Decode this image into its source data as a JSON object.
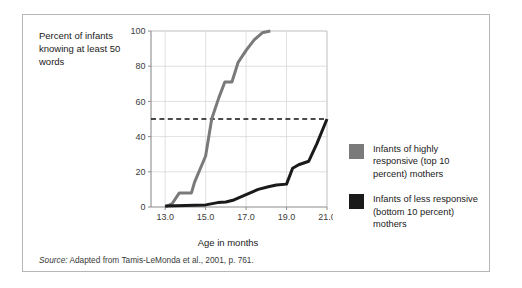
{
  "figure": {
    "y_axis_caption": "Percent of infants knowing at least 50 words",
    "source_prefix": "Source:",
    "source_text": " Adapted from Tamis-LeMonda et al., 2001, p. 761."
  },
  "legend": {
    "items": [
      {
        "label": "Infants of highly responsive (top 10 percent) mothers",
        "color": "#7a7a7a",
        "swatch_name": "legend-swatch-highly-responsive"
      },
      {
        "label": "Infants of less responsive (bottom 10 percent) mothers",
        "color": "#1a1a1a",
        "swatch_name": "legend-swatch-less-responsive"
      }
    ]
  },
  "chart_data": {
    "type": "line",
    "title": "",
    "xlabel": "Age in months",
    "ylabel": "Percent of infants knowing at least 50 words",
    "xlim": [
      12.3,
      21.0
    ],
    "ylim": [
      0,
      100
    ],
    "xticks": [
      13.0,
      15.0,
      17.0,
      19.0,
      21.0
    ],
    "xtick_labels": [
      "13.0",
      "15.0",
      "17.0",
      "19.0",
      "21.0"
    ],
    "yticks": [
      0,
      20,
      40,
      60,
      80,
      100
    ],
    "ytick_labels": [
      "0",
      "20",
      "40",
      "60",
      "80",
      "100"
    ],
    "grid": true,
    "legend_position": "right",
    "annotations": [
      {
        "type": "hline",
        "y": 50,
        "style": "dashed",
        "color": "#111111",
        "label": "50 percent reference line"
      }
    ],
    "series": [
      {
        "name": "Infants of highly responsive (top 10 percent) mothers",
        "color": "#7a7a7a",
        "x": [
          13.0,
          13.35,
          13.7,
          14.3,
          14.45,
          15.0,
          15.3,
          15.65,
          15.95,
          16.3,
          16.6,
          17.0,
          17.4,
          17.8,
          18.2
        ],
        "values": [
          0,
          2,
          8,
          8,
          14,
          29,
          50,
          62,
          71,
          71,
          82,
          89,
          95,
          99,
          100
        ]
      },
      {
        "name": "Infants of less responsive (bottom 10 percent) mothers",
        "color": "#1a1a1a",
        "x": [
          13.0,
          14.0,
          15.0,
          15.6,
          16.0,
          16.4,
          17.0,
          17.6,
          18.1,
          18.5,
          19.0,
          19.3,
          19.6,
          20.1,
          20.5,
          21.0
        ],
        "values": [
          0.5,
          0.8,
          1.2,
          2.5,
          2.8,
          4,
          7,
          10,
          11.5,
          12.5,
          13,
          22,
          24,
          26,
          36,
          50
        ]
      }
    ]
  }
}
